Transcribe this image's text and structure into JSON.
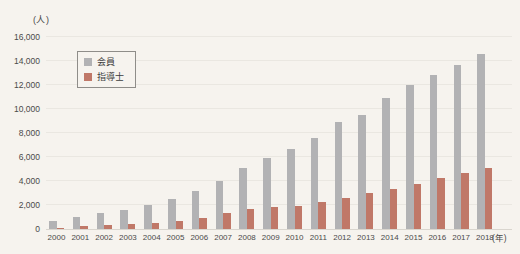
{
  "page": {
    "background": "#f6f3ee",
    "text_color": "#4a4a4a"
  },
  "chart_data": {
    "type": "bar",
    "title": "",
    "unit_y": "(人)",
    "unit_x": "(年)",
    "categories": [
      "2000",
      "2001",
      "2002",
      "2003",
      "2004",
      "2005",
      "2006",
      "2007",
      "2008",
      "2009",
      "2010",
      "2011",
      "2012",
      "2013",
      "2014",
      "2015",
      "2016",
      "2017",
      "2018"
    ],
    "series": [
      {
        "name": "会員",
        "color": "#b2b2b4",
        "values": [
          650,
          1000,
          1300,
          1600,
          2000,
          2500,
          3200,
          4000,
          5100,
          5900,
          6700,
          7600,
          8900,
          9500,
          10900,
          12000,
          12800,
          13700,
          14600
        ]
      },
      {
        "name": "指導士",
        "color": "#c07868",
        "values": [
          120,
          220,
          300,
          400,
          500,
          700,
          950,
          1300,
          1650,
          1800,
          1950,
          2250,
          2550,
          3000,
          3300,
          3750,
          4250,
          4700,
          5100
        ]
      }
    ],
    "ylim": [
      0,
      16000
    ],
    "ytick_step": 2000,
    "ytick_labels": [
      "0",
      "2,000",
      "4,000",
      "6,000",
      "8,000",
      "10,000",
      "12,000",
      "14,000",
      "16,000"
    ],
    "grid": true,
    "legend_position": "top-left-inside",
    "gridline_color": "#eae7e1",
    "baseline_color": "#d9d5ce"
  }
}
